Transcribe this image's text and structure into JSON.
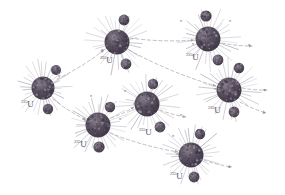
{
  "figure": {
    "background_color": "#ffffff",
    "nucleus_color": "#534a5c",
    "nucleus_highlight": "#8b8290",
    "fragment_color": "#5a5162",
    "spike_color": "#9a93a1",
    "arrow_color": "#b3acb8",
    "label_color": "#5d5663"
  },
  "isotope_label": {
    "mass_number": "235",
    "element": "U"
  },
  "neutron_label": "n",
  "nuclei": [
    {
      "id": "u1",
      "label_mass": "235",
      "label_element": "U",
      "x": 43,
      "y": 88,
      "r": 11.5,
      "label_x": 21,
      "label_y": 100,
      "fragments": [
        {
          "x": 56,
          "y": 70,
          "r": 5.0
        },
        {
          "x": 48,
          "y": 109,
          "r": 5.2
        }
      ],
      "neutron_labels": [
        {
          "text": "n",
          "x": 58,
          "y": 74
        }
      ]
    },
    {
      "id": "u2",
      "label_mass": "235",
      "label_element": "U",
      "x": 117,
      "y": 42,
      "r": 12.5,
      "label_x": 100,
      "label_y": 56,
      "fragments": [
        {
          "x": 124,
          "y": 20,
          "r": 5.4
        },
        {
          "x": 126,
          "y": 64,
          "r": 5.4
        }
      ],
      "neutron_labels": [
        {
          "text": "n",
          "x": 101,
          "y": 48
        }
      ]
    },
    {
      "id": "u3",
      "label_mass": "235",
      "label_element": "U",
      "x": 208,
      "y": 39,
      "r": 12.5,
      "label_x": 186,
      "label_y": 53,
      "fragments": [
        {
          "x": 206,
          "y": 16,
          "r": 5.6
        },
        {
          "x": 218,
          "y": 60,
          "r": 5.4
        }
      ],
      "neutron_labels": [
        {
          "text": "n",
          "x": 180,
          "y": 19
        },
        {
          "text": "n",
          "x": 229,
          "y": 19
        },
        {
          "text": "n",
          "x": 192,
          "y": 42
        },
        {
          "text": "n",
          "x": 248,
          "y": 43
        }
      ]
    },
    {
      "id": "u4",
      "label_mass": "235",
      "label_element": "U",
      "x": 229,
      "y": 90,
      "r": 12.5,
      "label_x": 208,
      "label_y": 106,
      "fragments": [
        {
          "x": 239,
          "y": 68,
          "r": 5.2
        },
        {
          "x": 234,
          "y": 112,
          "r": 5.4
        }
      ],
      "neutron_labels": [
        {
          "text": "n",
          "x": 214,
          "y": 87
        },
        {
          "text": "n",
          "x": 263,
          "y": 88
        },
        {
          "text": "n",
          "x": 263,
          "y": 111
        }
      ]
    },
    {
      "id": "u5",
      "label_mass": "235",
      "label_element": "U",
      "x": 98,
      "y": 125,
      "r": 12.5,
      "label_x": 74,
      "label_y": 140,
      "fragments": [
        {
          "x": 110,
          "y": 107,
          "r": 5.2
        },
        {
          "x": 99,
          "y": 147,
          "r": 5.6
        }
      ],
      "neutron_labels": [
        {
          "text": "n",
          "x": 84,
          "y": 119
        },
        {
          "text": "n",
          "x": 90,
          "y": 94
        },
        {
          "text": "n",
          "x": 119,
          "y": 117
        }
      ]
    },
    {
      "id": "u6",
      "label_mass": "235",
      "label_element": "U",
      "x": 147,
      "y": 104,
      "r": 12.5,
      "label_x": 139,
      "label_y": 128,
      "fragments": [
        {
          "x": 153,
          "y": 84,
          "r": 5.2
        },
        {
          "x": 160,
          "y": 127,
          "r": 5.4
        }
      ],
      "neutron_labels": [
        {
          "text": "n",
          "x": 133,
          "y": 102
        },
        {
          "text": "n",
          "x": 124,
          "y": 89
        },
        {
          "text": "n",
          "x": 180,
          "y": 113
        }
      ]
    },
    {
      "id": "u7",
      "label_mass": "235",
      "label_element": "U",
      "x": 191,
      "y": 155,
      "r": 12.5,
      "label_x": 170,
      "label_y": 172,
      "fragments": [
        {
          "x": 200,
          "y": 134,
          "r": 5.2
        },
        {
          "x": 194,
          "y": 177,
          "r": 5.4
        }
      ],
      "neutron_labels": [
        {
          "text": "n",
          "x": 176,
          "y": 152
        },
        {
          "text": "n",
          "x": 172,
          "y": 134
        },
        {
          "text": "n",
          "x": 228,
          "y": 165
        }
      ]
    }
  ],
  "neutron_paths": [
    {
      "from": "u1",
      "to": "u2",
      "x1": 57,
      "y1": 79,
      "x2": 104,
      "y2": 50
    },
    {
      "from": "u1",
      "to": "u5",
      "x1": 53,
      "y1": 99,
      "x2": 86,
      "y2": 120
    },
    {
      "from": "u2",
      "to": "u3",
      "x1": 130,
      "y1": 38,
      "x2": 194,
      "y2": 40
    },
    {
      "from": "u2",
      "to": "u4",
      "x1": 129,
      "y1": 50,
      "x2": 216,
      "y2": 86
    },
    {
      "from": "u5",
      "to": "u6",
      "x1": 111,
      "y1": 118,
      "x2": 134,
      "y2": 107
    },
    {
      "from": "u5",
      "to": "u7",
      "x1": 110,
      "y1": 133,
      "x2": 178,
      "y2": 152
    },
    {
      "from": "u6",
      "to": "out",
      "x1": 160,
      "y1": 110,
      "x2": 186,
      "y2": 117
    },
    {
      "from": "u3",
      "to": "out",
      "x1": 222,
      "y1": 43,
      "x2": 252,
      "y2": 46
    },
    {
      "from": "u4",
      "to": "out",
      "x1": 242,
      "y1": 88,
      "x2": 267,
      "y2": 90
    },
    {
      "from": "u4",
      "to": "out2",
      "x1": 240,
      "y1": 102,
      "x2": 266,
      "y2": 113
    },
    {
      "from": "u7",
      "to": "out",
      "x1": 204,
      "y1": 160,
      "x2": 232,
      "y2": 167
    }
  ]
}
